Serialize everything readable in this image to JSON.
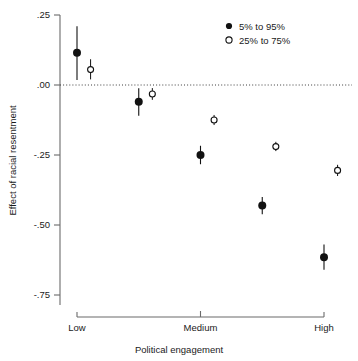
{
  "chart_data": {
    "type": "scatter",
    "title": "",
    "xlabel": "Political engagement",
    "ylabel": "Effect of racial resentment",
    "ylim": [
      -0.75,
      0.25
    ],
    "yticks": [
      0.25,
      0.0,
      -0.25,
      -0.5,
      -0.75
    ],
    "ytick_labels": [
      ".25",
      ".00",
      "-.25",
      "-.50",
      "-.75"
    ],
    "xticks": [
      0,
      2,
      4
    ],
    "xtick_labels": [
      "Low",
      "Medium",
      "High"
    ],
    "grid": false,
    "reference_line": {
      "y": 0.0,
      "style": "dotted"
    },
    "legend": {
      "position": "top-right",
      "entries": [
        {
          "label": "5% to 95%",
          "marker": "filled-circle"
        },
        {
          "label": "25% to 75%",
          "marker": "open-circle"
        }
      ]
    },
    "series": [
      {
        "name": "5% to 95%",
        "marker": "filled-circle",
        "x": [
          0,
          1,
          2,
          3,
          4
        ],
        "values": [
          0.115,
          -0.06,
          -0.25,
          -0.43,
          -0.615
        ],
        "ci_low": [
          0.018,
          -0.11,
          -0.283,
          -0.462,
          -0.66
        ],
        "ci_high": [
          0.21,
          -0.012,
          -0.217,
          -0.4,
          -0.57
        ]
      },
      {
        "name": "25% to 75%",
        "marker": "open-circle",
        "x": [
          0.22,
          1.22,
          2.22,
          3.22,
          4.22
        ],
        "values": [
          0.055,
          -0.032,
          -0.125,
          -0.22,
          -0.305
        ],
        "ci_low": [
          0.02,
          -0.053,
          -0.143,
          -0.236,
          -0.325
        ],
        "ci_high": [
          0.092,
          -0.011,
          -0.107,
          -0.203,
          -0.285
        ]
      }
    ]
  },
  "axes": {
    "y_title": "Effect of racial resentment",
    "x_title": "Political engagement"
  },
  "colors": {
    "marker": "#111111",
    "axis": "#555555",
    "reference_line": "#444444",
    "background": "#ffffff"
  }
}
